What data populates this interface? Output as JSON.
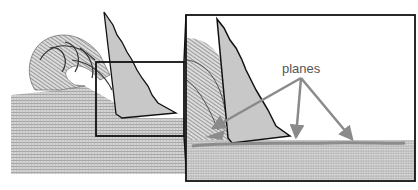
{
  "figure": {
    "annotation_label": "planes",
    "colors": {
      "mesh": "#aaaaaa",
      "tool": "#c8c8c8",
      "outline": "#111111",
      "arrow": "#8a8a8a",
      "plane": "#8c8c8c"
    },
    "parts": [
      "workpiece-mesh",
      "curled-chip",
      "cutting-tool",
      "zoom-box",
      "zoomed-inset"
    ]
  }
}
